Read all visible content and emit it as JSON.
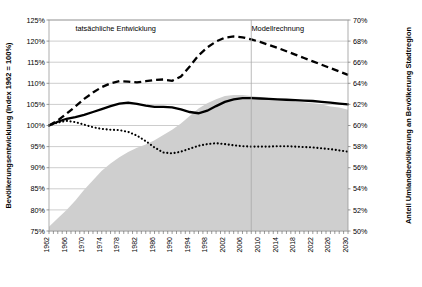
{
  "chart_data": {
    "type": "line",
    "title": "",
    "xlabel": "",
    "ylabel": "Bevölkerungsentwicklung (Index 1962 = 100%)",
    "ylabel_right": "Anteil Umlandbevölkerung an Bevölkerung Stadtregion",
    "grid": true,
    "legend_position": "bottom",
    "ylim": [
      75,
      125
    ],
    "ylim_right": [
      50,
      70
    ],
    "ytick_labels": [
      "125%",
      "120%",
      "115%",
      "110%",
      "105%",
      "100%",
      "95%",
      "90%",
      "85%",
      "80%",
      "75%"
    ],
    "ytick_values": [
      125,
      120,
      115,
      110,
      105,
      100,
      95,
      90,
      85,
      80,
      75
    ],
    "ytick_right_labels": [
      "70%",
      "68%",
      "66%",
      "64%",
      "62%",
      "60%",
      "58%",
      "56%",
      "54%",
      "52%",
      "50%"
    ],
    "ytick_right_values": [
      70,
      68,
      66,
      64,
      62,
      60,
      58,
      56,
      54,
      52,
      50
    ],
    "xlim": [
      1962,
      2030
    ],
    "xtick_labels": [
      "1962",
      "1966",
      "1970",
      "1974",
      "1978",
      "1982",
      "1986",
      "1990",
      "1994",
      "1998",
      "2002",
      "2006",
      "2010",
      "2014",
      "2018",
      "2022",
      "2026",
      "2030"
    ],
    "x": [
      1962,
      1964,
      1966,
      1968,
      1970,
      1972,
      1974,
      1976,
      1978,
      1980,
      1982,
      1984,
      1986,
      1988,
      1990,
      1992,
      1994,
      1996,
      1998,
      2000,
      2002,
      2004,
      2006,
      2008,
      2010,
      2012,
      2014,
      2016,
      2018,
      2020,
      2022,
      2024,
      2026,
      2028,
      2030
    ],
    "annotations": [
      {
        "text": "tatsächliche Entwicklung",
        "x": 1968,
        "y": 122.5
      },
      {
        "text": "Modellrechnung",
        "x": 2020,
        "y": 122.5
      }
    ],
    "divider_x": 2008,
    "series": [
      {
        "name": "Anteil Umlandbevölkerung",
        "style": "area",
        "axis": "right",
        "values": [
          50.4,
          51.2,
          52.0,
          52.9,
          53.9,
          54.8,
          55.7,
          56.4,
          57.0,
          57.5,
          57.9,
          58.2,
          58.6,
          59.1,
          59.6,
          60.2,
          60.9,
          61.6,
          62.1,
          62.5,
          62.8,
          62.9,
          62.9,
          62.8,
          62.7,
          62.6,
          62.5,
          62.4,
          62.3,
          62.2,
          62.1,
          62.0,
          61.8,
          61.7,
          61.5
        ]
      },
      {
        "name": "Kernstädte",
        "style": "dotted",
        "axis": "left",
        "values": [
          100.0,
          100.7,
          101.1,
          100.8,
          100.2,
          99.6,
          99.2,
          99.0,
          98.9,
          98.5,
          97.6,
          96.3,
          94.8,
          93.6,
          93.4,
          93.8,
          94.5,
          95.2,
          95.6,
          95.8,
          95.6,
          95.3,
          95.1,
          95.0,
          95.0,
          95.0,
          95.1,
          95.1,
          95.0,
          94.9,
          94.8,
          94.6,
          94.4,
          94.1,
          93.8
        ]
      },
      {
        "name": "Suburbia",
        "style": "dashed",
        "axis": "left",
        "values": [
          100.0,
          101.2,
          102.8,
          104.5,
          106.3,
          107.8,
          109.1,
          110.0,
          110.5,
          110.4,
          110.2,
          110.5,
          110.8,
          110.9,
          110.6,
          111.6,
          114.0,
          116.6,
          118.5,
          119.9,
          120.8,
          121.1,
          120.9,
          120.4,
          119.8,
          119.1,
          118.4,
          117.6,
          116.8,
          116.0,
          115.2,
          114.4,
          113.6,
          112.8,
          112.0
        ]
      },
      {
        "name": "Stadtregionen",
        "style": "solid",
        "axis": "left",
        "values": [
          100.0,
          100.9,
          101.6,
          102.0,
          102.5,
          103.2,
          103.9,
          104.6,
          105.2,
          105.4,
          105.1,
          104.7,
          104.4,
          104.4,
          104.3,
          103.8,
          103.2,
          102.9,
          103.5,
          104.6,
          105.6,
          106.2,
          106.5,
          106.5,
          106.4,
          106.3,
          106.2,
          106.1,
          106.0,
          105.9,
          105.8,
          105.6,
          105.4,
          105.2,
          105.0
        ]
      }
    ]
  },
  "legend": {
    "items": [
      {
        "label": "Anteil Umlandbevölkerung",
        "marker": "area-swatch"
      },
      {
        "label": "Kernstädte",
        "marker": "dotted-line"
      },
      {
        "label": "Suburbia",
        "marker": "dashed-line"
      },
      {
        "label": "Stadtregionen",
        "marker": "solid-line"
      }
    ]
  },
  "colors": {
    "area": "#cfcfcf",
    "line": "#000000",
    "grid": "#b8b8b8",
    "frame": "#9a9a9a",
    "background": "#ffffff"
  }
}
